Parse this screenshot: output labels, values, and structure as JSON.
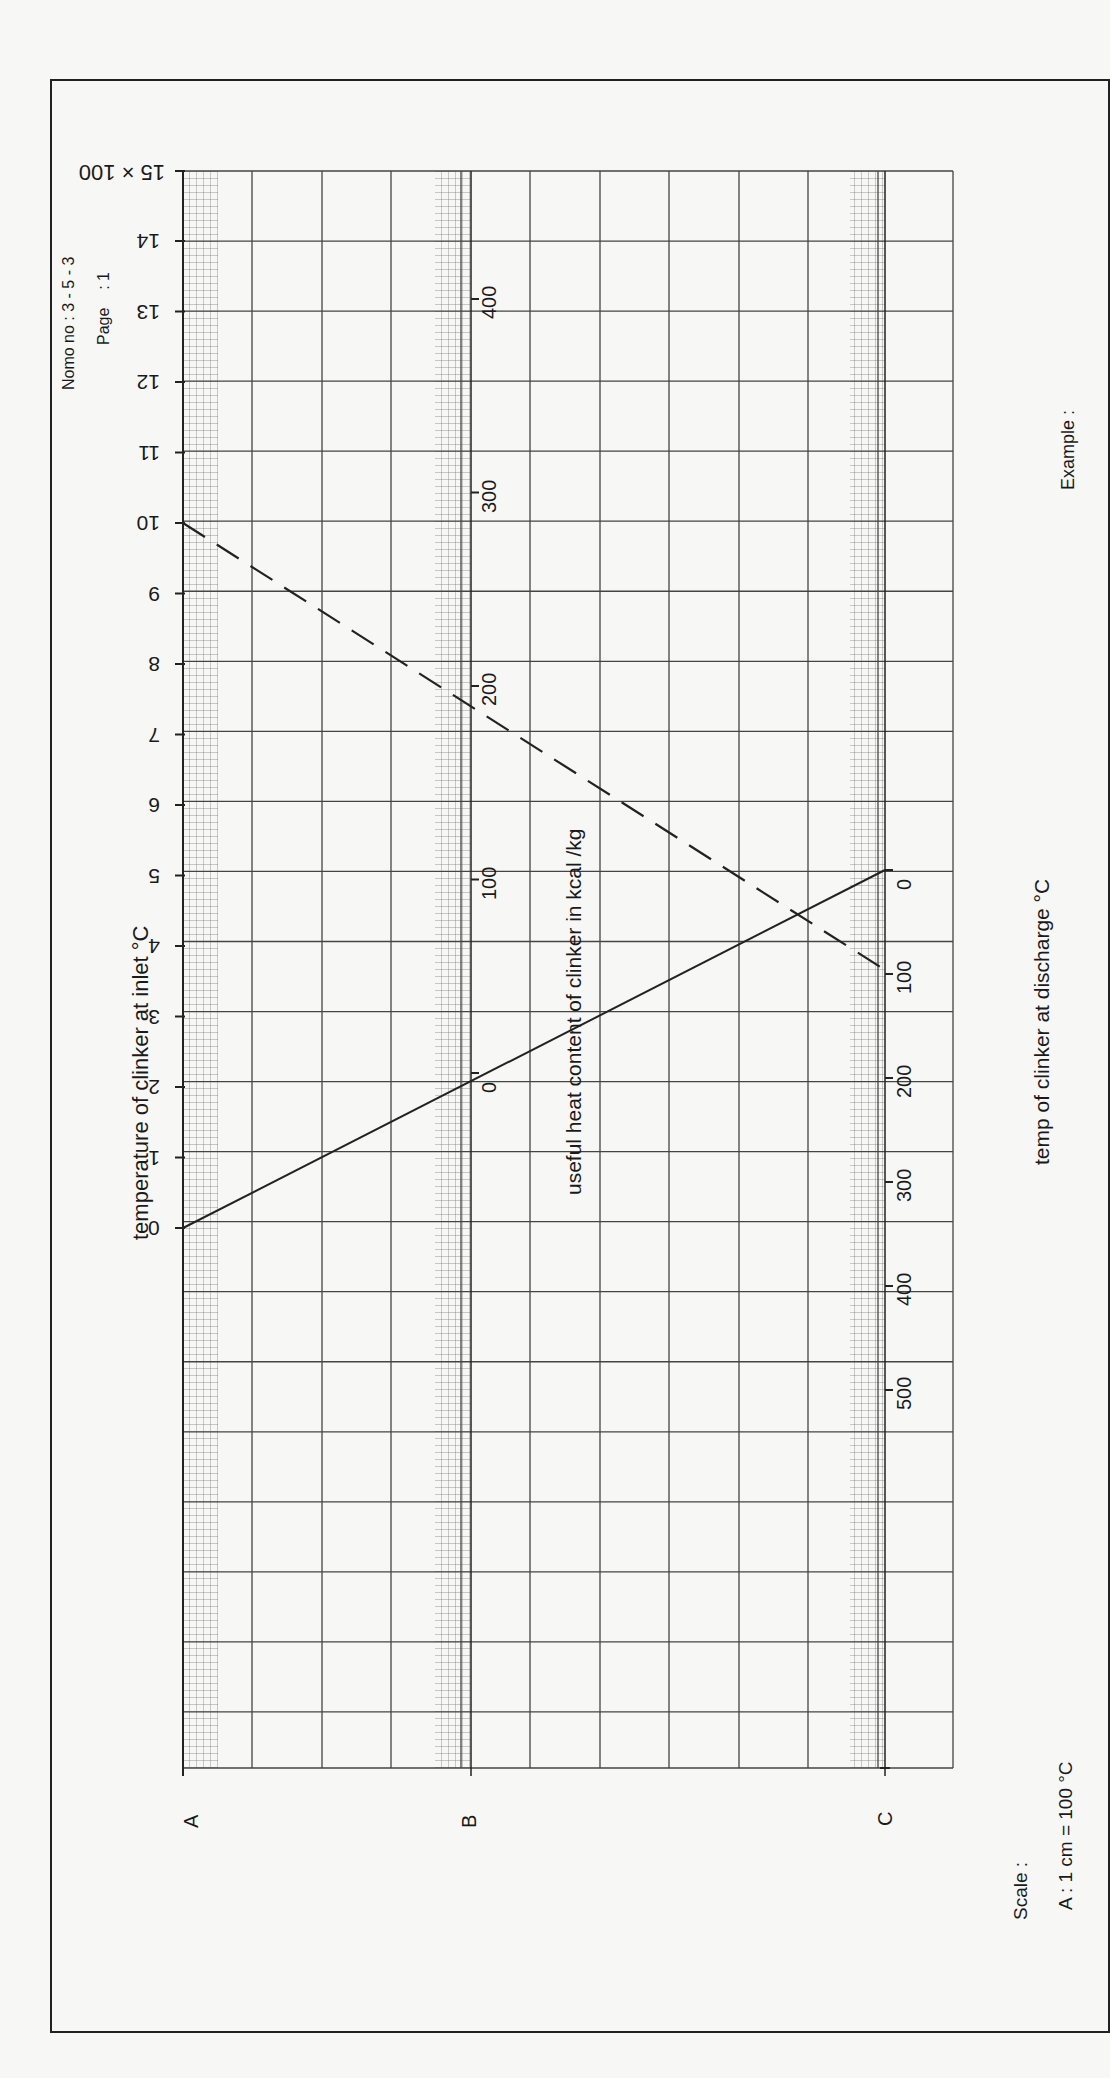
{
  "header": {
    "nomo_no": "Nomo no : 3 - 5 - 3",
    "page": "Page    : 1"
  },
  "axes": {
    "A": {
      "letter": "A",
      "title": "temperature of clinker  at inlet °C",
      "multiplier_label": "15 × 100",
      "ticks": [
        "0",
        "1",
        "2",
        "3",
        "4",
        "5",
        "6",
        "7",
        "8",
        "9",
        "10",
        "11",
        "12",
        "13",
        "14"
      ]
    },
    "B": {
      "letter": "B",
      "title": "useful heat content of clinker in kcal /kg",
      "ticks": [
        "0",
        "100",
        "200",
        "300",
        "400"
      ]
    },
    "C": {
      "letter": "C",
      "title": "temp  of  clinker at discharge °C",
      "ticks": [
        "0",
        "100",
        "200",
        "300",
        "400",
        "500"
      ]
    }
  },
  "footer": {
    "scale_label": "Scale :",
    "scale_value": "A : 1 cm = 100 °C",
    "example_label": "Example :"
  },
  "chart_data": {
    "type": "nomogram",
    "title": "Nomo no : 3 - 5 - 3",
    "scales": [
      {
        "name": "A",
        "label": "temperature of clinker at inlet °C",
        "unit": "°C ×100",
        "range": [
          0,
          15
        ],
        "ticks": [
          0,
          1,
          2,
          3,
          4,
          5,
          6,
          7,
          8,
          9,
          10,
          11,
          12,
          13,
          14,
          15
        ]
      },
      {
        "name": "B",
        "label": "useful heat content of clinker in kcal/kg",
        "unit": "kcal/kg",
        "range": [
          0,
          400
        ],
        "ticks": [
          0,
          100,
          200,
          300,
          400
        ]
      },
      {
        "name": "C",
        "label": "temp of clinker at discharge °C",
        "unit": "°C",
        "range": [
          0,
          500
        ],
        "ticks": [
          0,
          100,
          200,
          300,
          400,
          500
        ]
      }
    ],
    "example_lines": [
      {
        "style": "solid",
        "A": 0,
        "B": 0,
        "C": 0
      },
      {
        "style": "dashed",
        "A": 1000,
        "B": 200,
        "C": 100
      }
    ],
    "scale_note": "A : 1 cm = 100 °C"
  }
}
